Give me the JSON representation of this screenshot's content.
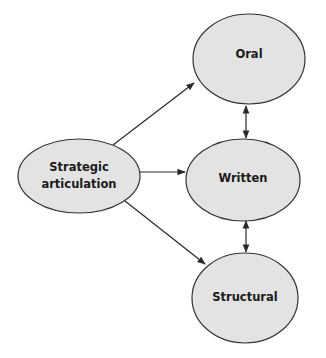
{
  "diagram": {
    "type": "flow",
    "colors": {
      "node_fill": "#e3e3e3",
      "node_stroke": "#333333",
      "edge": "#2a2a2a",
      "text": "#1a1a1a"
    },
    "nodes": [
      {
        "id": "strategic",
        "label_lines": [
          "Strategic",
          "articulation"
        ]
      },
      {
        "id": "oral",
        "label_lines": [
          "Oral"
        ]
      },
      {
        "id": "written",
        "label_lines": [
          "Written"
        ]
      },
      {
        "id": "structural",
        "label_lines": [
          "Structural"
        ]
      }
    ],
    "edges": [
      {
        "from": "strategic",
        "to": "oral",
        "direction": "forward"
      },
      {
        "from": "strategic",
        "to": "written",
        "direction": "forward"
      },
      {
        "from": "strategic",
        "to": "structural",
        "direction": "forward"
      },
      {
        "from": "oral",
        "to": "written",
        "direction": "both"
      },
      {
        "from": "written",
        "to": "structural",
        "direction": "both"
      }
    ]
  }
}
